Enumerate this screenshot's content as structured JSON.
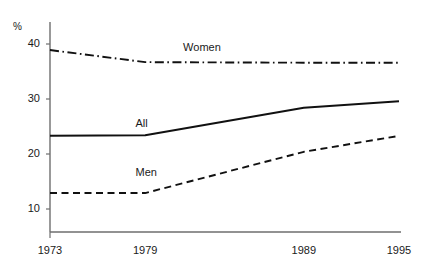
{
  "chart_data": {
    "type": "line",
    "title": "",
    "subtitle": "",
    "xlabel": "",
    "ylabel": "%",
    "unit_label": "%",
    "x": [
      1973,
      1979,
      1989,
      1995
    ],
    "categories": [
      "1973",
      "1979",
      "1989",
      "1995"
    ],
    "xlim": [
      1973,
      1995
    ],
    "ylim": [
      5,
      42
    ],
    "yticks": [
      10,
      20,
      30,
      40
    ],
    "ytick_labels": [
      "10",
      "20",
      "30",
      "40"
    ],
    "xticks": [
      1973,
      1979,
      1989,
      1995
    ],
    "xtick_labels": [
      "1973",
      "1979",
      "1989",
      "1995"
    ],
    "grid": false,
    "legend": "inline-annotations",
    "series": [
      {
        "name": "Women",
        "label": "Women",
        "style": "dash-dot",
        "color": "#111111",
        "values": [
          38.9,
          36.7,
          36.6,
          36.6
        ]
      },
      {
        "name": "All",
        "label": "All",
        "style": "solid",
        "color": "#111111",
        "values": [
          23.3,
          23.4,
          28.4,
          29.6
        ]
      },
      {
        "name": "Men",
        "label": "Men",
        "style": "dashed",
        "color": "#111111",
        "values": [
          12.9,
          12.9,
          20.4,
          23.3
        ]
      }
    ],
    "annotations": [
      {
        "text": "Women",
        "x": 1982.4,
        "y": 39.2
      },
      {
        "text": "All",
        "x": 1979.4,
        "y": 25.5
      },
      {
        "text": "Men",
        "x": 1979.4,
        "y": 16.6
      }
    ],
    "axis_color": "#6e6e6e"
  }
}
